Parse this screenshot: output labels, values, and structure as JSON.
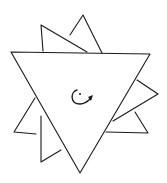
{
  "diagram": {
    "stroke_color": "#1a1a1a",
    "background": "#ffffff",
    "center_symbol": "rotation-arrow-clockwise"
  }
}
